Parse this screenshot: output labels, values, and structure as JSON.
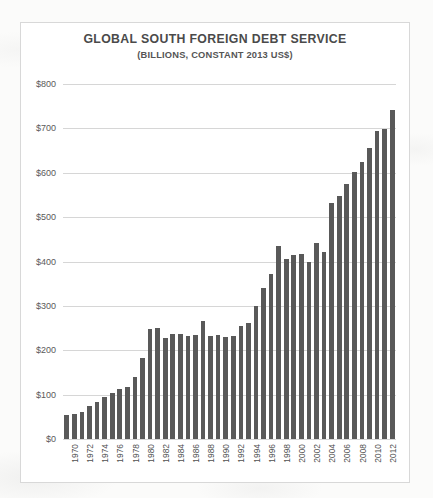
{
  "chart_data": {
    "type": "bar",
    "title": "GLOBAL SOUTH FOREIGN DEBT SERVICE",
    "subtitle": "(BILLIONS, CONSTANT 2013 US$)",
    "xlabel": "",
    "ylabel": "",
    "ylim": [
      0,
      800
    ],
    "ytick_step": 100,
    "ytick_labels": [
      "$0",
      "$100",
      "$200",
      "$300",
      "$400",
      "$500",
      "$600",
      "$700",
      "$800"
    ],
    "ytick_values": [
      0,
      100,
      200,
      300,
      400,
      500,
      600,
      700,
      800
    ],
    "grid": true,
    "legend": false,
    "bar_color": "#595959",
    "xtick_interval": 2,
    "categories": [
      "1970",
      "1971",
      "1972",
      "1973",
      "1974",
      "1975",
      "1976",
      "1977",
      "1978",
      "1979",
      "1980",
      "1981",
      "1982",
      "1983",
      "1984",
      "1985",
      "1986",
      "1987",
      "1988",
      "1989",
      "1990",
      "1991",
      "1992",
      "1993",
      "1994",
      "1995",
      "1996",
      "1997",
      "1998",
      "1999",
      "2000",
      "2001",
      "2002",
      "2003",
      "2004",
      "2005",
      "2006",
      "2007",
      "2008",
      "2009",
      "2010",
      "2011",
      "2012",
      "2013"
    ],
    "values": [
      55,
      56,
      62,
      75,
      84,
      95,
      104,
      112,
      118,
      140,
      182,
      247,
      250,
      228,
      236,
      236,
      233,
      234,
      265,
      233,
      234,
      229,
      232,
      254,
      261,
      300,
      341,
      371,
      435,
      405,
      415,
      417,
      400,
      441,
      422,
      531,
      548,
      574,
      602,
      625,
      655,
      693,
      698,
      742
    ],
    "xtick_labels": [
      "1970",
      "1972",
      "1974",
      "1976",
      "1978",
      "1980",
      "1982",
      "1984",
      "1986",
      "1988",
      "1990",
      "1992",
      "1994",
      "1996",
      "1998",
      "2000",
      "2002",
      "2004",
      "2006",
      "2008",
      "2010",
      "2012"
    ]
  }
}
